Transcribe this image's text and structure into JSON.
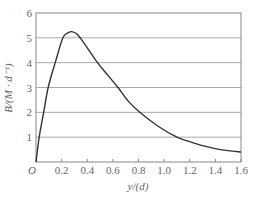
{
  "chart_data": {
    "type": "line",
    "title": "",
    "xlabel": "y/(d)",
    "ylabel": "B/(M · d⁻¹)",
    "origin_label": "O",
    "xlim": [
      0,
      1.6
    ],
    "ylim": [
      0,
      6
    ],
    "x_ticks": [
      0.2,
      0.4,
      0.6,
      0.8,
      1.0,
      1.2,
      1.4,
      1.6
    ],
    "x_tick_labels": [
      "0.2",
      "0.4",
      "0.6",
      "0.8",
      "1.0",
      "1.2",
      "1.4",
      "1.6"
    ],
    "y_ticks": [
      1,
      2,
      3,
      4,
      5,
      6
    ],
    "y_tick_labels": [
      "1",
      "2",
      "3",
      "4",
      "5",
      "6"
    ],
    "grid": {
      "horizontal": true,
      "vertical": false
    },
    "legend": null,
    "series": [
      {
        "name": "B",
        "color": "#333333",
        "x": [
          0,
          0.025,
          0.06,
          0.095,
          0.15,
          0.21,
          0.25,
          0.28,
          0.32,
          0.38,
          0.48,
          0.56,
          0.64,
          0.72,
          0.81,
          0.95,
          1.1,
          1.2,
          1.3,
          1.4,
          1.5,
          1.6
        ],
        "y": [
          0,
          1.0,
          2.0,
          3.0,
          4.0,
          5.0,
          5.2,
          5.25,
          5.15,
          4.75,
          4.0,
          3.5,
          3.0,
          2.45,
          2.0,
          1.45,
          1.0,
          0.82,
          0.66,
          0.54,
          0.46,
          0.4
        ]
      }
    ]
  },
  "style": {
    "curve_color": "#333333",
    "grid_color": "#aaaaaa",
    "frame_color": "#888888",
    "text_color": "#666666"
  }
}
